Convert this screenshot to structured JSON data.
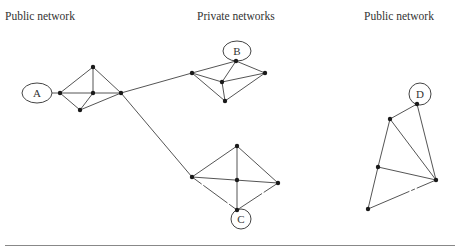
{
  "labels": {
    "left": "Public network",
    "middle": "Private networks",
    "right": "Public network"
  },
  "endpoints": {
    "A": "A",
    "B": "B",
    "C": "C",
    "D": "D"
  },
  "colors": {
    "edge": "#555555",
    "node": "#1a1a1a",
    "text": "#333333"
  }
}
